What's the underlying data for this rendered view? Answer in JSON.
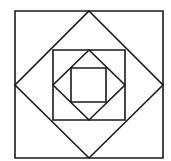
{
  "diagram": {
    "stroke_color": "#1a1a1a",
    "background": "#ffffff",
    "shapes": [
      {
        "name": "outer-square",
        "points": "15,11 163,11 163,158 15,158"
      },
      {
        "name": "outer-diamond",
        "points": "89,11 163,85 89,158 15,85"
      },
      {
        "name": "middle-square",
        "points": "53,50 125,50 125,120 53,120"
      },
      {
        "name": "inner-diamond",
        "points": "89,50 125,85 89,120 53,85"
      },
      {
        "name": "inner-square",
        "points": "71,68 106,68 106,102 71,102"
      }
    ]
  }
}
